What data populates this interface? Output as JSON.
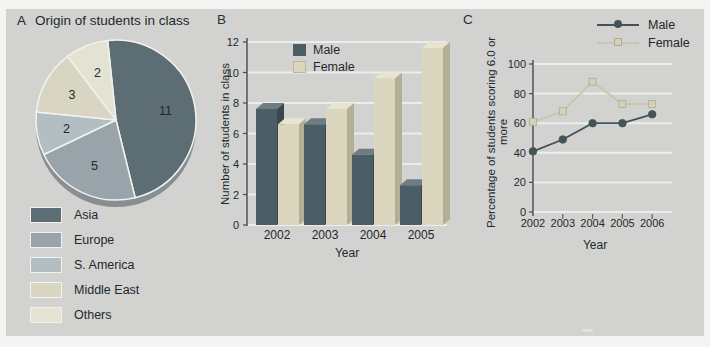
{
  "colors": {
    "page_bg": "#f4f5f3",
    "panel_bg": "#d2d3d0",
    "gridline": "#eceee9",
    "axis": "#454b4e",
    "text": "#23282c",
    "pie_shadow": "#878f93"
  },
  "chart_data": [
    {
      "id": "A",
      "type": "pie",
      "panel_label": "A",
      "title": "Origin of students in class",
      "labels": [
        "Asia",
        "Europe",
        "S. America",
        "Middle East",
        "Others"
      ],
      "values": [
        11,
        5,
        2,
        3,
        2
      ],
      "colors": [
        "#5d6d74",
        "#98a4a9",
        "#b3bec2",
        "#d8d6c2",
        "#e4e2d2"
      ],
      "start_angle_deg": -6,
      "legend_position": "bottom-left",
      "value_labels_shown": true
    },
    {
      "id": "B",
      "type": "bar",
      "panel_label": "B",
      "categories": [
        "2002",
        "2003",
        "2004",
        "2005"
      ],
      "series": [
        {
          "name": "Male",
          "values": [
            8,
            7,
            5,
            3
          ],
          "color": "#4d5d65",
          "side": "#39474e",
          "top": "#6e7d84"
        },
        {
          "name": "Female",
          "values": [
            7,
            8,
            10,
            12
          ],
          "color": "#dad7be",
          "side": "#b2af96",
          "top": "#e7e4cf"
        }
      ],
      "xlabel": "Year",
      "ylabel": "Number of students in class",
      "ylim": [
        0,
        12
      ],
      "yticks": [
        0,
        2,
        4,
        6,
        8,
        10,
        12
      ],
      "grid": true,
      "style": "3d",
      "legend_position": "top-left-inside"
    },
    {
      "id": "C",
      "type": "line",
      "panel_label": "C",
      "x": [
        "2002",
        "2003",
        "2004",
        "2005",
        "2006"
      ],
      "series": [
        {
          "name": "Male",
          "values": [
            41,
            49,
            60,
            60,
            66
          ],
          "color": "#44535a",
          "marker": "circle",
          "marker_fill": "#44535a",
          "marker_edge": "#44535a"
        },
        {
          "name": "Female",
          "values": [
            61,
            68,
            88,
            73,
            73
          ],
          "color": "#c9c6ae",
          "marker": "square",
          "marker_fill": "#d4d1b8",
          "marker_edge": "#adaa92"
        }
      ],
      "xlabel": "Year",
      "ylabel": "Percentage of students scoring 6.0 or more",
      "ylim": [
        0,
        100
      ],
      "yticks": [
        0,
        20,
        40,
        60,
        80,
        100
      ],
      "grid": true,
      "legend_position": "top-right"
    }
  ]
}
